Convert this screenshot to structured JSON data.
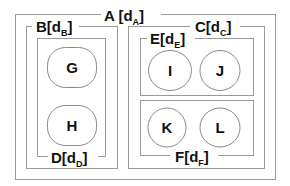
{
  "diagram": {
    "containers": {
      "A": {
        "label": "A [d",
        "sub": "A",
        "close": "]"
      },
      "B": {
        "label": "B[d",
        "sub": "B",
        "close": "]"
      },
      "C": {
        "label": "C[d",
        "sub": "C",
        "close": "]"
      },
      "D": {
        "label": "D[d",
        "sub": "D",
        "close": "]"
      },
      "E": {
        "label": "E[d",
        "sub": "E",
        "close": "]"
      },
      "F": {
        "label": "F[d",
        "sub": "F",
        "close": "]"
      }
    },
    "nodes": {
      "G": "G",
      "H": "H",
      "I": "I",
      "J": "J",
      "K": "K",
      "L": "L"
    },
    "hierarchy": {
      "A": [
        "B",
        "C"
      ],
      "B": [
        "D"
      ],
      "D": [
        "G",
        "H"
      ],
      "C": [
        "E",
        "F"
      ],
      "E": [
        "I",
        "J"
      ],
      "F": [
        "K",
        "L"
      ]
    }
  }
}
